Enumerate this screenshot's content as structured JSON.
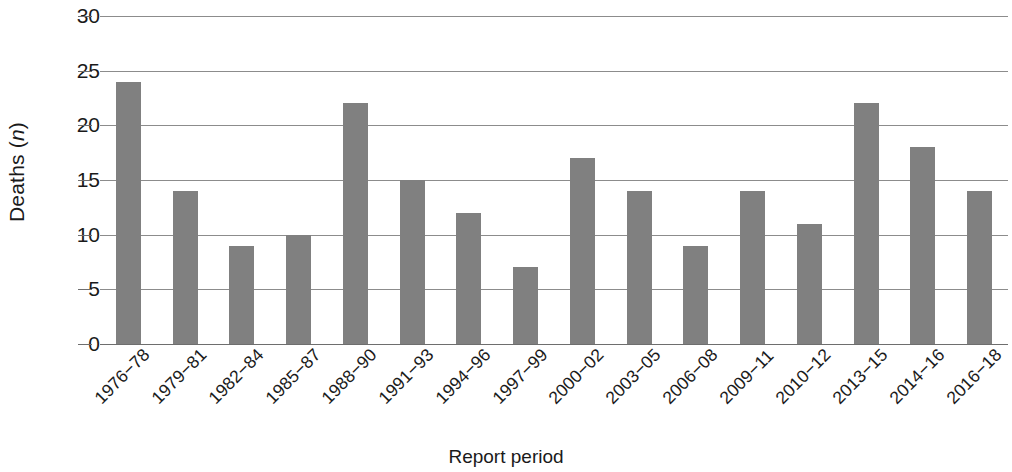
{
  "chart_data": {
    "type": "bar",
    "title": "",
    "xlabel": "Report period",
    "ylabel": "Deaths (n)",
    "ylabel_prefix": "Deaths (",
    "ylabel_italic": "n",
    "ylabel_suffix": ")",
    "categories": [
      "1976−78",
      "1979−81",
      "1982−84",
      "1985−87",
      "1988−90",
      "1991−93",
      "1994−96",
      "1997−99",
      "2000−02",
      "2003−05",
      "2006−08",
      "2009−11",
      "2010−12",
      "2013−15",
      "2014−16",
      "2016−18"
    ],
    "values": [
      24,
      14,
      9,
      10,
      22,
      15,
      12,
      7,
      17,
      14,
      9,
      14,
      11,
      22,
      18,
      14
    ],
    "ylim": [
      0,
      30
    ],
    "yticks": [
      0,
      5,
      10,
      15,
      20,
      25,
      30
    ],
    "ytick_labels": [
      "0",
      "5",
      "10",
      "15",
      "20",
      "25",
      "30"
    ],
    "grid": true,
    "legend": false,
    "bar_color": "#808080",
    "grid_color": "#8c8c8c",
    "axis_color": "#6e6e6e",
    "text_color": "#1a1a1a"
  }
}
